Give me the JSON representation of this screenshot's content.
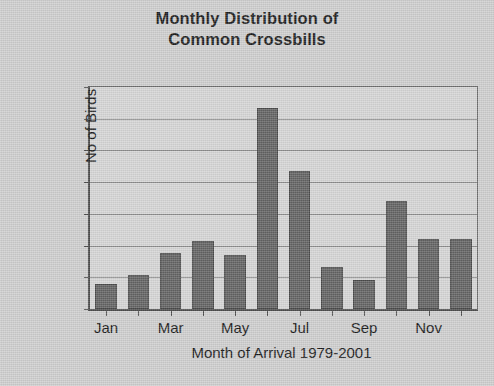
{
  "chart_data": {
    "type": "bar",
    "title": "Monthly Distribution of Common Crossbills",
    "title_line1": "Monthly Distribution of",
    "title_line2": "Common Crossbills",
    "xlabel": "Month of Arrival 1979-2001",
    "ylabel": "No of Birds",
    "categories": [
      "Jan",
      "Feb",
      "Mar",
      "Apr",
      "May",
      "Jun",
      "Jul",
      "Aug",
      "Sep",
      "Oct",
      "Nov",
      "Dec"
    ],
    "visible_tick_labels": [
      "Jan",
      "",
      "Mar",
      "",
      "May",
      "",
      "Jul",
      "",
      "Sep",
      "",
      "Nov",
      ""
    ],
    "values": [
      160,
      215,
      355,
      430,
      340,
      1270,
      870,
      265,
      180,
      680,
      440,
      440
    ],
    "ylim": [
      0,
      1400
    ],
    "ytick_labels": [
      "0",
      "200",
      "400",
      "600",
      "800",
      "1000",
      "1200",
      "1400"
    ],
    "ytick_values": [
      0,
      200,
      400,
      600,
      800,
      1000,
      1200,
      1400
    ],
    "grid": true,
    "legend": false,
    "bar_color": "#646464",
    "plot_background": "#d6d6d6",
    "figure_background": "#cfcfcf",
    "axis_color": "#4d4d4d",
    "gridline_color": "#8e8e8e",
    "text_color": "#1a1a1a"
  }
}
